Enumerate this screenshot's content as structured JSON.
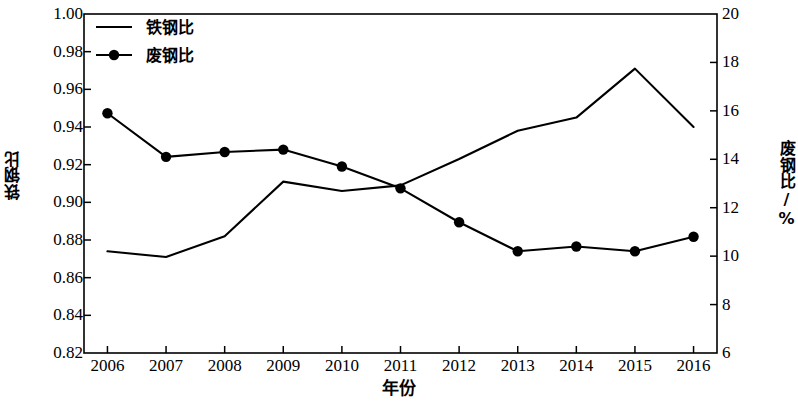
{
  "chart_data": {
    "type": "line",
    "title": "",
    "subtitle": "",
    "xlabel": "年份",
    "ylabel": "铁钢比",
    "y2label": "废钢比/%",
    "grid": false,
    "legend_position": "top-left",
    "categories": [
      "2006",
      "2007",
      "2008",
      "2009",
      "2010",
      "2011",
      "2012",
      "2013",
      "2014",
      "2015",
      "2016"
    ],
    "x": [
      2006,
      2007,
      2008,
      2009,
      2010,
      2011,
      2012,
      2013,
      2014,
      2015,
      2016
    ],
    "xlim": [
      2005.6,
      2016.4
    ],
    "ylim": [
      0.82,
      1.0
    ],
    "y2lim": [
      6,
      20
    ],
    "yticks": [
      "0.82",
      "0.84",
      "0.86",
      "0.88",
      "0.90",
      "0.92",
      "0.94",
      "0.96",
      "0.98",
      "1.00"
    ],
    "ytick_values": [
      0.82,
      0.84,
      0.86,
      0.88,
      0.9,
      0.92,
      0.94,
      0.96,
      0.98,
      1.0
    ],
    "y2ticks": [
      "6",
      "8",
      "10",
      "12",
      "14",
      "16",
      "18",
      "20"
    ],
    "y2tick_values": [
      6,
      8,
      10,
      12,
      14,
      16,
      18,
      20
    ],
    "series": [
      {
        "name": "铁钢比",
        "axis": "left",
        "marker": "none",
        "color": "#000000",
        "values": [
          0.874,
          0.871,
          0.882,
          0.911,
          0.906,
          0.909,
          0.923,
          0.938,
          0.945,
          0.971,
          0.94
        ]
      },
      {
        "name": "废钢比",
        "axis": "right",
        "marker": "circle",
        "color": "#000000",
        "values": [
          15.9,
          14.1,
          14.3,
          14.4,
          13.7,
          12.8,
          11.4,
          10.2,
          10.4,
          10.2,
          10.8
        ]
      }
    ]
  },
  "legend": {
    "items": [
      {
        "label": "铁钢比",
        "marker": "line"
      },
      {
        "label": "废钢比",
        "marker": "line-circle"
      }
    ]
  },
  "axes": {
    "x_title": "年份",
    "y_left_title": "铁钢比",
    "y_right_title": "废钢比/%"
  }
}
